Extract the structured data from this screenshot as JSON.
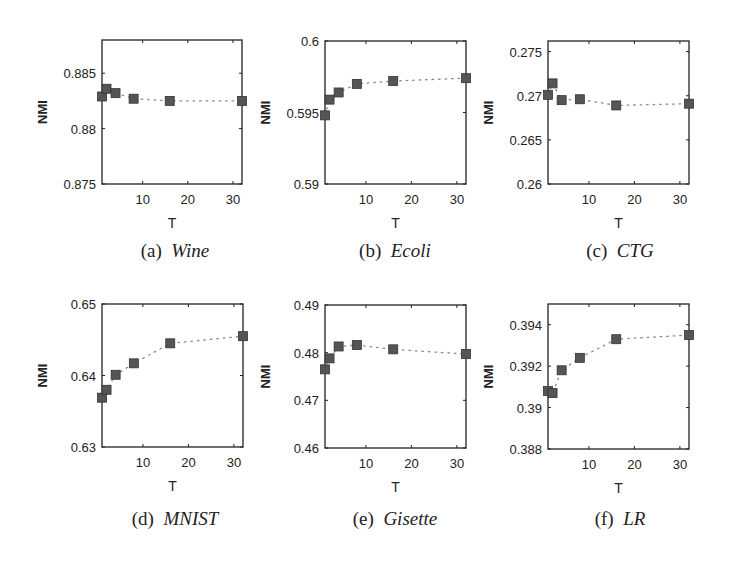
{
  "figure": {
    "marker_color": "#555555",
    "line_color": "#888888"
  },
  "chart_data": [
    {
      "type": "line",
      "label": "(a)",
      "title": "Wine",
      "xlabel": "T",
      "ylabel": "NMI",
      "x": [
        1,
        2,
        4,
        8,
        16,
        32
      ],
      "values": [
        0.8829,
        0.8836,
        0.8832,
        0.8827,
        0.8825,
        0.8825
      ],
      "xlim": [
        1,
        32
      ],
      "ylim": [
        0.875,
        0.888
      ],
      "xticks": [
        10,
        20,
        30
      ],
      "yticks": [
        0.875,
        0.88,
        0.885
      ],
      "ytick_labels": [
        "0.875",
        "0.88",
        "0.885"
      ],
      "grid": false,
      "marker": "square",
      "linestyle": "dotted"
    },
    {
      "type": "line",
      "label": "(b)",
      "title": "Ecoli",
      "xlabel": "T",
      "ylabel": "NMI",
      "x": [
        1,
        2,
        4,
        8,
        16,
        32
      ],
      "values": [
        0.5948,
        0.5959,
        0.5964,
        0.597,
        0.5972,
        0.5974
      ],
      "xlim": [
        1,
        32
      ],
      "ylim": [
        0.59,
        0.6
      ],
      "xticks": [
        10,
        20,
        30
      ],
      "yticks": [
        0.59,
        0.595,
        0.6
      ],
      "ytick_labels": [
        "0.59",
        "0.595",
        "0.6"
      ],
      "grid": false,
      "marker": "square",
      "linestyle": "dotted"
    },
    {
      "type": "line",
      "label": "(c)",
      "title": "CTG",
      "xlabel": "T",
      "ylabel": "NMI",
      "x": [
        1,
        2,
        4,
        8,
        16,
        32
      ],
      "values": [
        0.2701,
        0.2714,
        0.2695,
        0.2696,
        0.2689,
        0.2691
      ],
      "xlim": [
        1,
        32
      ],
      "ylim": [
        0.26,
        0.2762
      ],
      "xticks": [
        10,
        20,
        30
      ],
      "yticks": [
        0.26,
        0.265,
        0.27,
        0.275
      ],
      "ytick_labels": [
        "0.26",
        "0.265",
        "0.27",
        "0.275"
      ],
      "grid": false,
      "marker": "square",
      "linestyle": "dotted"
    },
    {
      "type": "line",
      "label": "(d)",
      "title": "MNIST",
      "xlabel": "T",
      "ylabel": "NMI",
      "x": [
        1,
        2,
        4,
        8,
        16,
        32
      ],
      "values": [
        0.6369,
        0.638,
        0.6401,
        0.6417,
        0.6445,
        0.6455
      ],
      "xlim": [
        1,
        32
      ],
      "ylim": [
        0.63,
        0.65
      ],
      "xticks": [
        10,
        20,
        30
      ],
      "yticks": [
        0.63,
        0.64,
        0.65
      ],
      "ytick_labels": [
        "0.63",
        "0.64",
        "0.65"
      ],
      "grid": false,
      "marker": "square",
      "linestyle": "dotted"
    },
    {
      "type": "line",
      "label": "(e)",
      "title": "Gisette",
      "xlabel": "T",
      "ylabel": "NMI",
      "x": [
        1,
        2,
        4,
        8,
        16,
        32
      ],
      "values": [
        0.4765,
        0.4788,
        0.4813,
        0.4816,
        0.4807,
        0.4797
      ],
      "xlim": [
        1,
        32
      ],
      "ylim": [
        0.46,
        0.49
      ],
      "xticks": [
        10,
        20,
        30
      ],
      "yticks": [
        0.46,
        0.47,
        0.48,
        0.49
      ],
      "ytick_labels": [
        "0.46",
        "0.47",
        "0.48",
        "0.49"
      ],
      "grid": false,
      "marker": "square",
      "linestyle": "dotted"
    },
    {
      "type": "line",
      "label": "(f)",
      "title": "LR",
      "xlabel": "T",
      "ylabel": "NMI",
      "x": [
        1,
        2,
        4,
        8,
        16,
        32
      ],
      "values": [
        0.3908,
        0.3907,
        0.3918,
        0.3924,
        0.3933,
        0.3935
      ],
      "xlim": [
        1,
        32
      ],
      "ylim": [
        0.388,
        0.395
      ],
      "xticks": [
        10,
        20,
        30
      ],
      "yticks": [
        0.388,
        0.39,
        0.392,
        0.394
      ],
      "ytick_labels": [
        "0.388",
        "0.39",
        "0.392",
        "0.394"
      ],
      "grid": false,
      "marker": "square",
      "linestyle": "dotted"
    }
  ]
}
